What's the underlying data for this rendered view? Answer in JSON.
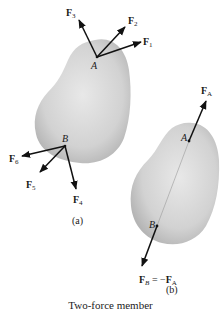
{
  "figure": {
    "caption": "Two-force member",
    "colors": {
      "body_fill_light": "#e6e6e6",
      "body_fill_dark": "#b9b9b9",
      "arrow": "#111111",
      "text": "#1a1a1a"
    }
  },
  "panel_a": {
    "label": "(a)",
    "points": [
      {
        "name": "A",
        "x": 97,
        "y": 57
      },
      {
        "name": "B",
        "x": 65,
        "y": 146
      }
    ],
    "forces": [
      {
        "name": "F",
        "sub": "1",
        "at": "A",
        "tip": [
          141,
          42
        ]
      },
      {
        "name": "F",
        "sub": "2",
        "at": "A",
        "tip": [
          125,
          27
        ]
      },
      {
        "name": "F",
        "sub": "3",
        "at": "A",
        "tip": [
          79,
          20
        ]
      },
      {
        "name": "F",
        "sub": "4",
        "at": "B",
        "tip": [
          76,
          189
        ]
      },
      {
        "name": "F",
        "sub": "5",
        "at": "B",
        "tip": [
          40,
          172
        ]
      },
      {
        "name": "F",
        "sub": "6",
        "at": "B",
        "tip": [
          22,
          156
        ]
      }
    ]
  },
  "panel_b": {
    "label": "(b)",
    "points": [
      {
        "name": "A",
        "x": 189,
        "y": 141
      },
      {
        "name": "B",
        "x": 157,
        "y": 226
      }
    ],
    "forces": [
      {
        "name": "F",
        "sub": "A",
        "at": "A",
        "tip": [
          206,
          101
        ],
        "label": "FA"
      },
      {
        "name": "F",
        "sub": "B",
        "at": "B",
        "tip": [
          142,
          266
        ],
        "label": "FB = −FA",
        "eq": " = −",
        "rhs": "F",
        "rhs_sub": "A"
      }
    ]
  }
}
